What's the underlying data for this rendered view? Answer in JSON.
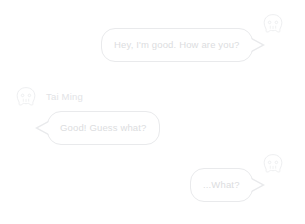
{
  "conversation": {
    "messages": [
      {
        "id": "msg-1",
        "side": "right",
        "text": "Hey, I'm good. How are you?",
        "avatar_icon": "face-avatar-icon",
        "sender_name": null
      },
      {
        "id": "msg-2",
        "side": "left",
        "text": "Good! Guess what?",
        "avatar_icon": "face-avatar-icon",
        "sender_name": "Tai Ming"
      },
      {
        "id": "msg-3",
        "side": "right",
        "text": "...What?",
        "avatar_icon": "face-avatar-icon",
        "sender_name": null
      }
    ]
  },
  "colors": {
    "background": "#ffffff",
    "bubble_border": "#e9eaec",
    "bubble_fill": "#ffffff",
    "message_text": "#dcdde0",
    "sender_name_text": "#e2e3e6",
    "avatar_stroke": "#eeeff1"
  }
}
